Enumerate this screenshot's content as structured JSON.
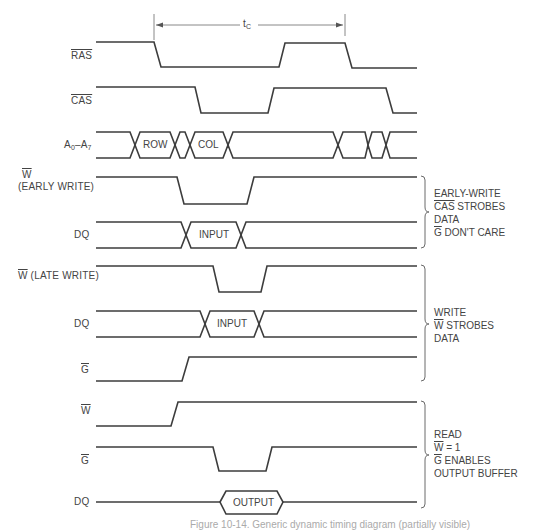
{
  "figure": {
    "type": "timing-diagram",
    "period_label": "t",
    "period_subscript": "C",
    "caption": "Figure 10-14. Generic dynamic timing diagram (partially visible)"
  },
  "signals": {
    "ras": {
      "label": "RAS",
      "overbar": true
    },
    "cas": {
      "label": "CAS",
      "overbar": true
    },
    "addr": {
      "label_main": "A",
      "sub0": "0",
      "dash": "–",
      "label_main2": "A",
      "sub7": "7",
      "row": "ROW",
      "col": "COL"
    },
    "w_early": {
      "label": "W",
      "overbar": true,
      "sublabel": "(EARLY WRITE)"
    },
    "dq_early": {
      "label": "DQ",
      "data": "INPUT"
    },
    "w_late": {
      "label": "W",
      "overbar": true,
      "suffix": " (LATE WRITE)"
    },
    "dq_late": {
      "label": "DQ",
      "data": "INPUT"
    },
    "g_late": {
      "label": "G",
      "overbar": true
    },
    "w_read": {
      "label": "W",
      "overbar": true
    },
    "g_read": {
      "label": "G",
      "overbar": true
    },
    "dq_read": {
      "label": "DQ",
      "data": "OUTPUT"
    }
  },
  "notes": {
    "early_write": {
      "line1": "EARLY-WRITE",
      "line2_ol": "CAS",
      "line2_rest": " STROBES",
      "line3": "DATA",
      "line4_ol": "G",
      "line4_rest": " DON'T CARE"
    },
    "late_write": {
      "line1": "WRITE",
      "line2_ol": "W",
      "line2_rest": " STROBES",
      "line3": "DATA"
    },
    "read": {
      "line1": "READ",
      "line2_ol": "W",
      "line2_rest": " = 1",
      "line3_ol": "G",
      "line3_rest": " ENABLES",
      "line4": "OUTPUT BUFFER"
    }
  },
  "colors": {
    "ink": "#3d3d3d",
    "background": "#ffffff"
  }
}
